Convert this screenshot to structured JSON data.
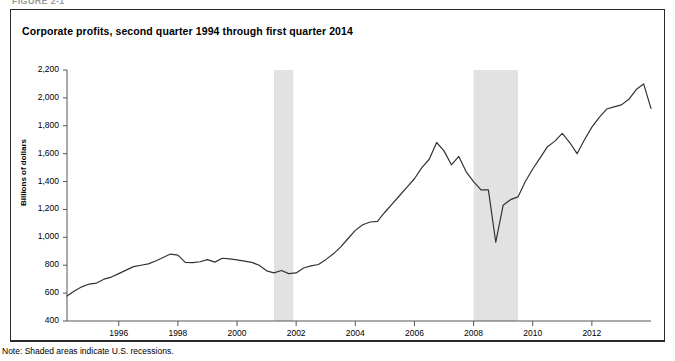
{
  "figure_label": "FIGURE 2-1",
  "chart_title": "Corporate profits, second quarter 1994 through first quarter 2014",
  "note": "Note: Shaded areas indicate U.S. recessions.",
  "colors": {
    "line": "#333333",
    "recession_band": "#e2e2e2",
    "axis": "#555555",
    "border": "#2b2b2b",
    "background": "#ffffff"
  },
  "chart_data": {
    "type": "line",
    "title": "Corporate profits, second quarter 1994 through first quarter 2014",
    "xlabel": "",
    "ylabel": "Billions of dollars",
    "ylim": [
      400,
      2200
    ],
    "ytick_labels": [
      "400",
      "600",
      "800",
      "1,000",
      "1,200",
      "1,400",
      "1,600",
      "1,800",
      "2,000",
      "2,200"
    ],
    "ytick_values": [
      400,
      600,
      800,
      1000,
      1200,
      1400,
      1600,
      1800,
      2000,
      2200
    ],
    "xlim": [
      1994.25,
      2014.0
    ],
    "xtick_labels": [
      "1996",
      "1998",
      "2000",
      "2002",
      "2004",
      "2006",
      "2008",
      "2010",
      "2012"
    ],
    "xtick_values": [
      1996,
      1998,
      2000,
      2002,
      2004,
      2006,
      2008,
      2010,
      2012
    ],
    "grid": false,
    "legend": "none",
    "annotations": [
      "Note: Shaded areas indicate U.S. recessions."
    ],
    "shaded_regions": [
      {
        "label": "2001 recession",
        "start": 2001.25,
        "end": 2001.9
      },
      {
        "label": "2008-2009 recession",
        "start": 2008.0,
        "end": 2009.5
      }
    ],
    "series": [
      {
        "name": "Corporate profits",
        "units": "Billions of dollars",
        "x": [
          1994.25,
          1994.5,
          1994.75,
          1995.0,
          1995.25,
          1995.5,
          1995.75,
          1996.0,
          1996.25,
          1996.5,
          1996.75,
          1997.0,
          1997.25,
          1997.5,
          1997.75,
          1998.0,
          1998.25,
          1998.5,
          1998.75,
          1999.0,
          1999.25,
          1999.5,
          1999.75,
          2000.0,
          2000.25,
          2000.5,
          2000.75,
          2001.0,
          2001.25,
          2001.5,
          2001.75,
          2002.0,
          2002.25,
          2002.5,
          2002.75,
          2003.0,
          2003.25,
          2003.5,
          2003.75,
          2004.0,
          2004.25,
          2004.5,
          2004.75,
          2005.0,
          2005.25,
          2005.5,
          2005.75,
          2006.0,
          2006.25,
          2006.5,
          2006.75,
          2007.0,
          2007.25,
          2007.5,
          2007.75,
          2008.0,
          2008.25,
          2008.5,
          2008.75,
          2009.0,
          2009.25,
          2009.5,
          2009.75,
          2010.0,
          2010.25,
          2010.5,
          2010.75,
          2011.0,
          2011.25,
          2011.5,
          2011.75,
          2012.0,
          2012.25,
          2012.5,
          2012.75,
          2013.0,
          2013.25,
          2013.5,
          2013.75,
          2014.0
        ],
        "values": [
          580,
          615,
          645,
          665,
          672,
          700,
          715,
          740,
          765,
          790,
          800,
          810,
          830,
          855,
          880,
          872,
          820,
          818,
          825,
          840,
          822,
          850,
          845,
          838,
          830,
          820,
          800,
          760,
          745,
          762,
          740,
          745,
          780,
          795,
          805,
          840,
          880,
          930,
          990,
          1050,
          1090,
          1110,
          1115,
          1180,
          1240,
          1300,
          1360,
          1420,
          1500,
          1560,
          1680,
          1620,
          1520,
          1580,
          1470,
          1400,
          1340,
          1340,
          965,
          1230,
          1270,
          1290,
          1400,
          1490,
          1570,
          1650,
          1690,
          1745,
          1680,
          1600,
          1700,
          1790,
          1860,
          1920,
          1935,
          1950,
          1990,
          2060,
          2100,
          1925
        ]
      }
    ]
  }
}
